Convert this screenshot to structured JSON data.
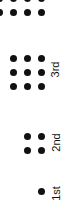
{
  "dot_color": "#111111",
  "groups": [
    {
      "label": "1st",
      "rows": 1,
      "cols": 1,
      "count": 1
    },
    {
      "label": "2nd",
      "rows": 2,
      "cols": 2,
      "count": 4
    },
    {
      "label": "3rd",
      "rows": 3,
      "cols": 3,
      "count": 9
    },
    {
      "label": "4th",
      "rows": 4,
      "cols": 4,
      "count": 16,
      "partially_visible": true
    }
  ]
}
